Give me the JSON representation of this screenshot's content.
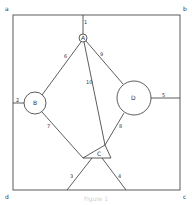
{
  "diagram": {
    "corners": {
      "a": "a",
      "b": "b",
      "c": "c",
      "d": "d"
    },
    "nodes": {
      "A": "A",
      "B": "B",
      "C": "C",
      "D": "D"
    },
    "edges": {
      "e1": "1",
      "e2": "2",
      "e3": "3",
      "e4": "4",
      "e5": "5",
      "e6": "6",
      "e7": "7",
      "e8": "8",
      "e9": "9",
      "e10": "10"
    },
    "caption": "Figure 1",
    "colors": {
      "stroke": "#333333",
      "background": "#ffffff"
    }
  }
}
